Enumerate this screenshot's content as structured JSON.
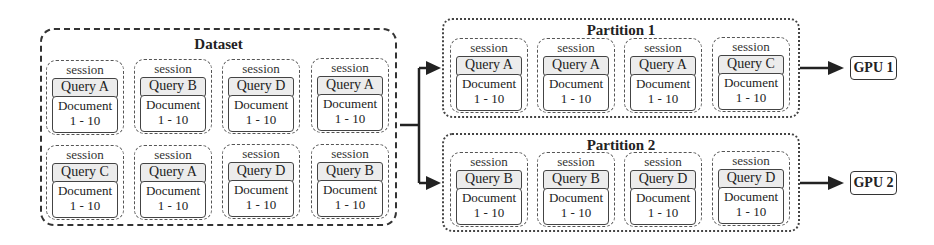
{
  "dataset": {
    "title": "Dataset",
    "sessions": [
      {
        "label": "session",
        "query": "Query A",
        "doc_label": "Document",
        "doc_range": "1 - 10"
      },
      {
        "label": "session",
        "query": "Query B",
        "doc_label": "Document",
        "doc_range": "1 - 10"
      },
      {
        "label": "session",
        "query": "Query D",
        "doc_label": "Document",
        "doc_range": "1 - 10"
      },
      {
        "label": "session",
        "query": "Query A",
        "doc_label": "Document",
        "doc_range": "1 - 10"
      },
      {
        "label": "session",
        "query": "Query C",
        "doc_label": "Document",
        "doc_range": "1 - 10"
      },
      {
        "label": "session",
        "query": "Query A",
        "doc_label": "Document",
        "doc_range": "1 - 10"
      },
      {
        "label": "session",
        "query": "Query D",
        "doc_label": "Document",
        "doc_range": "1 - 10"
      },
      {
        "label": "session",
        "query": "Query B",
        "doc_label": "Document",
        "doc_range": "1 - 10"
      }
    ]
  },
  "partitions": [
    {
      "title": "Partition 1",
      "gpu": "GPU 1",
      "sessions": [
        {
          "label": "session",
          "query": "Query A",
          "doc_label": "Document",
          "doc_range": "1 - 10"
        },
        {
          "label": "session",
          "query": "Query A",
          "doc_label": "Document",
          "doc_range": "1 - 10"
        },
        {
          "label": "session",
          "query": "Query A",
          "doc_label": "Document",
          "doc_range": "1 - 10"
        },
        {
          "label": "session",
          "query": "Query C",
          "doc_label": "Document",
          "doc_range": "1 - 10"
        }
      ]
    },
    {
      "title": "Partition 2",
      "gpu": "GPU 2",
      "sessions": [
        {
          "label": "session",
          "query": "Query B",
          "doc_label": "Document",
          "doc_range": "1 - 10"
        },
        {
          "label": "session",
          "query": "Query B",
          "doc_label": "Document",
          "doc_range": "1 - 10"
        },
        {
          "label": "session",
          "query": "Query D",
          "doc_label": "Document",
          "doc_range": "1 - 10"
        },
        {
          "label": "session",
          "query": "Query D",
          "doc_label": "Document",
          "doc_range": "1 - 10"
        }
      ]
    }
  ],
  "colors": {
    "line": "#222222",
    "query_fill": "#ececec",
    "background": "#ffffff"
  }
}
